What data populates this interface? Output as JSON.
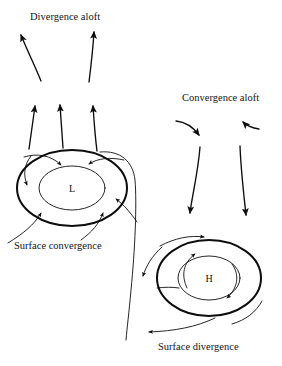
{
  "figure": {
    "type": "meteorological-circulation-diagram",
    "background_color": "#ffffff",
    "line_color": "#0d0d0d",
    "width": 282,
    "height": 366
  },
  "labels": {
    "divergence_aloft": "Divergence aloft",
    "convergence_aloft": "Convergence aloft",
    "surface_convergence": "Surface convergence",
    "surface_divergence": "Surface divergence"
  },
  "systems": {
    "low": {
      "letter": "L",
      "name": "low-pressure-center",
      "center_x": 72,
      "center_y": 188,
      "rotation": "counterclockwise",
      "surface_flow": "inward",
      "aloft_flow": "outward"
    },
    "high": {
      "letter": "H",
      "name": "high-pressure-center",
      "center_x": 209,
      "center_y": 278,
      "rotation": "clockwise",
      "surface_flow": "outward",
      "aloft_flow": "inward"
    }
  },
  "label_positions": {
    "divergence_aloft": {
      "x": 30,
      "y": 20
    },
    "convergence_aloft": {
      "x": 182,
      "y": 101
    },
    "surface_convergence": {
      "x": 14,
      "y": 249
    },
    "surface_divergence": {
      "x": 158,
      "y": 350
    }
  }
}
